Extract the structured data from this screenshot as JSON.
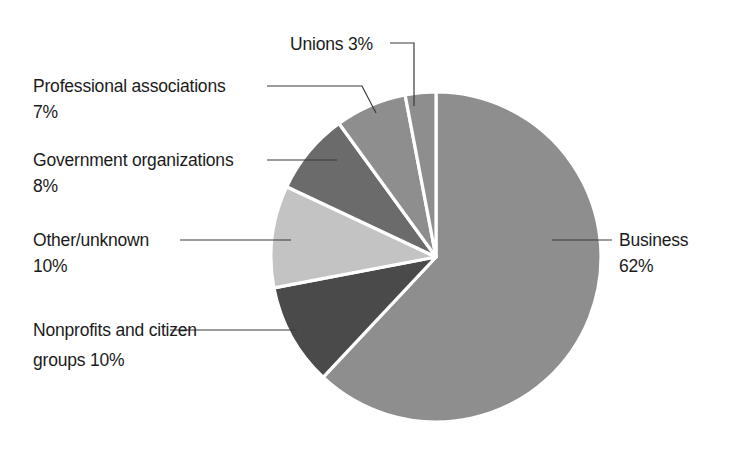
{
  "chart_data": {
    "type": "pie",
    "title": "",
    "subtitle": "",
    "xlabel": "",
    "ylabel": "",
    "legend_position": "callout-labels",
    "grid": false,
    "units": "percent",
    "total": 100,
    "categories": [
      "Business",
      "Nonprofits and citizen groups",
      "Other/unknown",
      "Government organizations",
      "Professional associations",
      "Unions"
    ],
    "values": [
      62,
      10,
      10,
      8,
      7,
      3
    ],
    "slices": [
      {
        "name": "Business",
        "label_line1": "Business",
        "label_line2": "62%",
        "value": 62,
        "value_text": "62%",
        "color": "#8e8e8e"
      },
      {
        "name": "Nonprofits and citizen groups",
        "label_line1": "Nonprofits and citizen",
        "label_line2": "groups  10%",
        "value": 10,
        "value_text": "10%",
        "color": "#4a4a4a"
      },
      {
        "name": "Other/unknown",
        "label_line1": "Other/unknown",
        "label_line2": "10%",
        "value": 10,
        "value_text": "10%",
        "color": "#c3c3c3"
      },
      {
        "name": "Government organizations",
        "label_line1": "Government organizations",
        "label_line2": "8%",
        "value": 8,
        "value_text": "8%",
        "color": "#6b6b6b"
      },
      {
        "name": "Professional associations",
        "label_line1": "Professional associations",
        "label_line2": "7%",
        "value": 7,
        "value_text": "7%",
        "color": "#8e8e8e"
      },
      {
        "name": "Unions",
        "label_line1": "Unions  3%",
        "label_line2": "",
        "value": 3,
        "value_text": "3%",
        "color": "#8e8e8e"
      }
    ],
    "colors": {
      "background": "#ffffff",
      "text": "#1b1b1b",
      "leader_line": "#3a3a3a",
      "slice_separator": "#ffffff"
    },
    "geometry": {
      "center_x": 436,
      "center_y": 257,
      "radius": 165
    }
  }
}
